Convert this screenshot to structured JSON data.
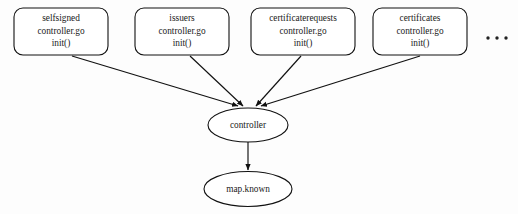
{
  "diagram": {
    "title_text": "",
    "background_color": "#fdfdfd",
    "stroke_color": "#111111",
    "text_color": "#1a1a1a",
    "controller_nodes": [
      {
        "id": "selfsigned",
        "line1": "selfsigned",
        "line2": "controller.go",
        "line3": "init()"
      },
      {
        "id": "issuers",
        "line1": "issuers",
        "line2": "controller.go",
        "line3": "init()"
      },
      {
        "id": "certificaterequests",
        "line1": "certificaterequests",
        "line2": "controller.go",
        "line3": "init()"
      },
      {
        "id": "certificates",
        "line1": "certificates",
        "line2": "controller.go",
        "line3": "init()"
      }
    ],
    "ellipsis": {
      "label": "...",
      "meaning": "more-controllers-omitted"
    },
    "hub_node": {
      "id": "controller",
      "label": "controller"
    },
    "sink_node": {
      "id": "map-known",
      "label": "map.known"
    },
    "edges": [
      {
        "from": "selfsigned",
        "to": "controller"
      },
      {
        "from": "issuers",
        "to": "controller"
      },
      {
        "from": "certificaterequests",
        "to": "controller"
      },
      {
        "from": "certificates",
        "to": "controller"
      },
      {
        "from": "controller",
        "to": "map.known"
      }
    ]
  }
}
